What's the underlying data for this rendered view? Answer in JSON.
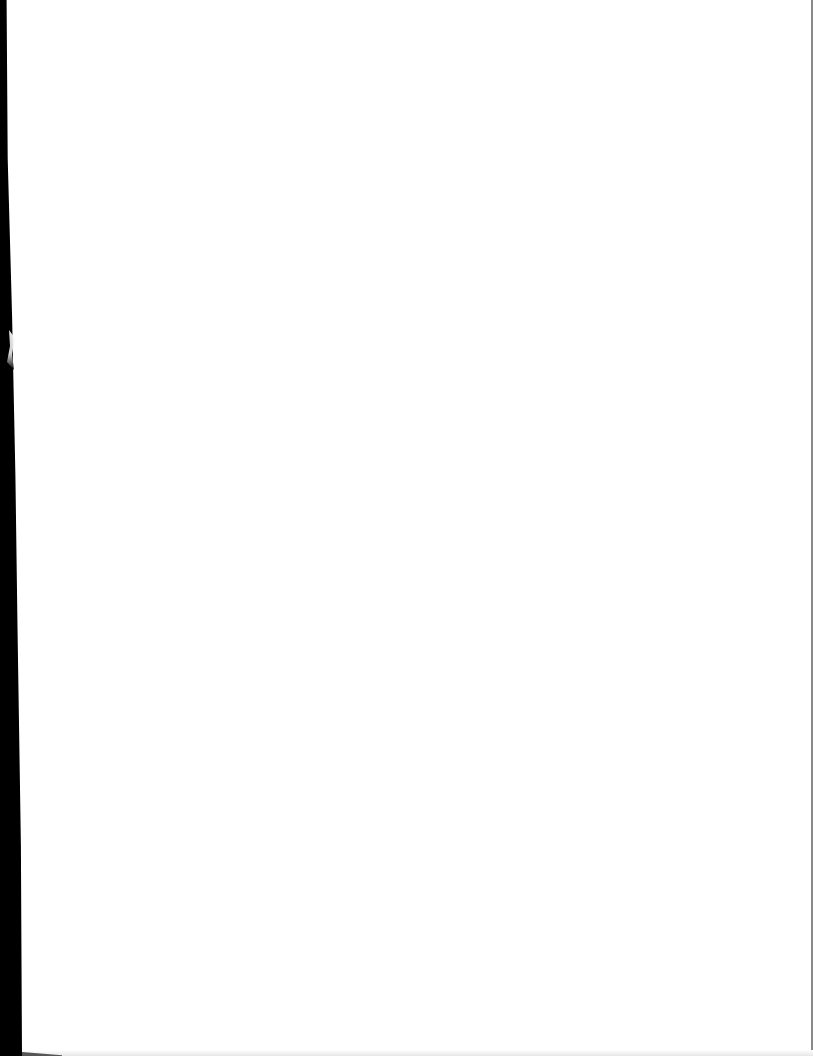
{
  "document": {
    "type": "scanned-page",
    "content": "",
    "colors": {
      "paper": "#ffffff",
      "scan_edge": "#000000",
      "border": "#8a8a8a"
    }
  }
}
